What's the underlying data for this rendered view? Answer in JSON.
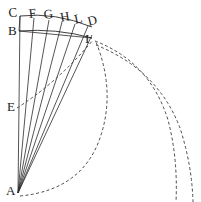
{
  "figure": {
    "kind": "geometric-diagram",
    "background_color": "#ffffff",
    "stroke_color": "#2a2a2a",
    "dashed_stroke_color": "#4a4a4a",
    "width": 201,
    "height": 202,
    "labels": [
      {
        "id": "C",
        "text": "C",
        "x": 8,
        "y": 6,
        "rotation": -4
      },
      {
        "id": "F",
        "text": "F",
        "x": 28,
        "y": 7,
        "rotation": -6
      },
      {
        "id": "G",
        "text": "G",
        "x": 43,
        "y": 8,
        "rotation": -7
      },
      {
        "id": "H",
        "text": "H",
        "x": 59,
        "y": 11,
        "rotation": -10
      },
      {
        "id": "L",
        "text": "L",
        "x": 73,
        "y": 13,
        "rotation": -12
      },
      {
        "id": "D",
        "text": "D",
        "x": 86,
        "y": 15,
        "rotation": -14
      },
      {
        "id": "B",
        "text": "B",
        "x": 8,
        "y": 24,
        "rotation": 0
      },
      {
        "id": "I",
        "text": "I",
        "x": 85,
        "y": 32,
        "rotation": 0
      },
      {
        "id": "E",
        "text": "E",
        "x": 7,
        "y": 100,
        "rotation": 0
      },
      {
        "id": "A",
        "text": "A",
        "x": 6,
        "y": 184,
        "rotation": 0
      }
    ],
    "apex": {
      "id": "A",
      "x": 18,
      "y": 193
    },
    "fan_lines": [
      {
        "name": "A-C",
        "from": "A",
        "to": "C",
        "x1": 18,
        "y1": 193,
        "x2": 20,
        "y2": 16
      },
      {
        "name": "A-F",
        "from": "A",
        "to": "F",
        "x1": 18,
        "y1": 193,
        "x2": 34,
        "y2": 18
      },
      {
        "name": "A-G",
        "from": "A",
        "to": "G",
        "x1": 18,
        "y1": 193,
        "x2": 49,
        "y2": 20
      },
      {
        "name": "A-H",
        "from": "A",
        "to": "H",
        "x1": 18,
        "y1": 193,
        "x2": 62,
        "y2": 22
      },
      {
        "name": "A-L",
        "from": "A",
        "to": "L",
        "x1": 18,
        "y1": 193,
        "x2": 75,
        "y2": 24
      },
      {
        "name": "A-D",
        "from": "A",
        "to": "D",
        "x1": 18,
        "y1": 193,
        "x2": 88,
        "y2": 26
      },
      {
        "name": "A-I",
        "from": "A",
        "to": "I",
        "x1": 18,
        "y1": 193,
        "x2": 92,
        "y2": 35
      }
    ],
    "arcs": [
      {
        "name": "arc-C-D",
        "from": "C",
        "to": "D",
        "d": "M 20 16 Q 55 12 92 27"
      },
      {
        "name": "arc-B-I",
        "from": "B",
        "to": "I",
        "d": "M 19 31 Q 56 28 92 38"
      }
    ],
    "straight_segments": [
      {
        "name": "segment-B-C",
        "from": "B",
        "to": "C",
        "x1": 19,
        "y1": 31,
        "x2": 20,
        "y2": 16
      },
      {
        "name": "segment-B-row",
        "from": "B",
        "to": "I",
        "x1": 19,
        "y1": 31,
        "x2": 92,
        "y2": 38
      }
    ],
    "dashed_curves": [
      {
        "name": "trajectory-E-to-I",
        "d": "M 17 108 Q 58 82 93 40"
      },
      {
        "name": "trajectory-A-inner-loop",
        "d": "M 20 196 Q 82 190 100 138 Q 116 92 96 42"
      },
      {
        "name": "trajectory-mid",
        "d": "M 95 41 Q 150 62 168 120 Q 178 158 176 202"
      },
      {
        "name": "trajectory-outer",
        "d": "M 96 45 Q 158 70 180 128 Q 192 165 193 202"
      }
    ]
  }
}
